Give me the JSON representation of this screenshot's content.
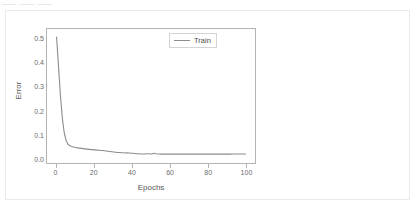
{
  "page": {
    "top_strip_text": "—— —— ——"
  },
  "chart_data": {
    "type": "line",
    "title": "",
    "xlabel": "Epochs",
    "ylabel": "Error",
    "xlim": [
      -5,
      105
    ],
    "ylim": [
      -0.02,
      0.545
    ],
    "grid": false,
    "legend_position": "top-right",
    "line_color": "#8c8c8c",
    "xticks": [
      "0",
      "20",
      "40",
      "60",
      "80",
      "100"
    ],
    "xtick_values": [
      0,
      20,
      40,
      60,
      80,
      100
    ],
    "yticks": [
      "0.0",
      "0.1",
      "0.2",
      "0.3",
      "0.4",
      "0.5"
    ],
    "ytick_values": [
      0.0,
      0.1,
      0.2,
      0.3,
      0.4,
      0.5
    ],
    "series": [
      {
        "name": "Train",
        "x": [
          0,
          1,
          2,
          3,
          4,
          5,
          6,
          7,
          8,
          9,
          10,
          11,
          12,
          13,
          14,
          15,
          16,
          17,
          18,
          19,
          20,
          21,
          22,
          23,
          24,
          25,
          26,
          27,
          28,
          29,
          30,
          31,
          32,
          33,
          34,
          35,
          36,
          37,
          38,
          39,
          40,
          41,
          42,
          43,
          44,
          45,
          46,
          47,
          48,
          49,
          50,
          51,
          52,
          53,
          54,
          55,
          56,
          57,
          58,
          59,
          60,
          61,
          62,
          63,
          64,
          65,
          66,
          67,
          68,
          69,
          70,
          71,
          72,
          73,
          74,
          75,
          76,
          77,
          78,
          79,
          80,
          81,
          82,
          83,
          84,
          85,
          86,
          87,
          88,
          89,
          90,
          91,
          92,
          93,
          94,
          95,
          96,
          97,
          98,
          99
        ],
        "values": [
          0.512,
          0.395,
          0.272,
          0.178,
          0.115,
          0.082,
          0.066,
          0.06,
          0.057,
          0.055,
          0.053,
          0.051,
          0.05,
          0.049,
          0.048,
          0.047,
          0.046,
          0.045,
          0.044,
          0.044,
          0.043,
          0.042,
          0.041,
          0.04,
          0.04,
          0.039,
          0.038,
          0.037,
          0.036,
          0.035,
          0.034,
          0.033,
          0.032,
          0.032,
          0.031,
          0.031,
          0.03,
          0.031,
          0.03,
          0.029,
          0.029,
          0.028,
          0.027,
          0.027,
          0.026,
          0.026,
          0.026,
          0.027,
          0.027,
          0.026,
          0.026,
          0.029,
          0.027,
          0.026,
          0.026,
          0.025,
          0.025,
          0.025,
          0.025,
          0.025,
          0.025,
          0.026,
          0.025,
          0.025,
          0.025,
          0.025,
          0.025,
          0.025,
          0.025,
          0.025,
          0.025,
          0.025,
          0.025,
          0.025,
          0.025,
          0.025,
          0.025,
          0.025,
          0.025,
          0.025,
          0.025,
          0.025,
          0.025,
          0.025,
          0.025,
          0.025,
          0.025,
          0.025,
          0.025,
          0.025,
          0.025,
          0.025,
          0.026,
          0.026,
          0.026,
          0.026,
          0.026,
          0.026,
          0.026,
          0.026
        ]
      }
    ]
  }
}
